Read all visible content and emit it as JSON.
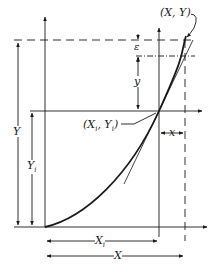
{
  "diagram": {
    "type": "geometric construction (curve with tangent, coordinate shift)",
    "colors": {
      "line": "#1a1a1a",
      "background": "#ffffff"
    },
    "labels": {
      "point_end": "(X, Y)",
      "point_start_open": "(X",
      "point_start_sub_x": "i",
      "point_start_mid": ", Y",
      "point_start_sub_y": "i",
      "point_start_close": ")",
      "epsilon": "ε",
      "small_y": "y",
      "small_x": "x",
      "big_Y": "Y",
      "Yi_main": "Y",
      "Yi_sub": "i",
      "Xi_main": "X",
      "Xi_sub": "i",
      "big_X": "X"
    },
    "elements": [
      "primary x-axis",
      "primary y-axis",
      "secondary axes through (Xi, Yi)",
      "curve from origin to (X, Y)",
      "tangent line at (Xi, Yi)",
      "dashed guide lines to (X, Y)",
      "dimension arrows: Y, Yi, Xi, X, x, y, epsilon"
    ]
  }
}
